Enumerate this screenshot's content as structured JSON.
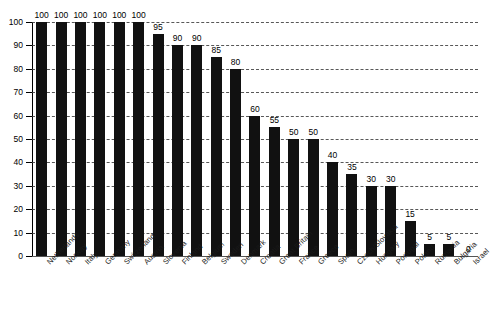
{
  "chart_data": {
    "type": "bar",
    "title": "",
    "subtitle": "",
    "xlabel": "",
    "ylabel": "",
    "ylim": [
      0,
      100
    ],
    "grid": true,
    "legend": "none",
    "value_labels": true,
    "bar_color": "#111111",
    "categories": [
      "Netherlands",
      "Norway",
      "Italy",
      "Germany",
      "Switzerland",
      "Austria",
      "Slovenia",
      "Finland",
      "Belgium",
      "Sweden",
      "Denmark",
      "Croatia",
      "Great Britain",
      "France",
      "Greece",
      "Spain",
      "Czech/Slovakia",
      "Hungary",
      "Portugal",
      "Poland",
      "Rumania",
      "Bulgaria",
      "Israel"
    ],
    "values": [
      100,
      100,
      100,
      100,
      100,
      100,
      95,
      90,
      90,
      85,
      80,
      60,
      55,
      50,
      50,
      40,
      35,
      30,
      30,
      15,
      5,
      5,
      0
    ],
    "value_label_text": [
      "100",
      "100",
      "100",
      "100",
      "100",
      "100",
      "95",
      "90",
      "90",
      "85",
      "80",
      "60",
      "55",
      "50",
      "50",
      "40",
      "35",
      "30",
      "30",
      "15",
      "5",
      "5",
      "0"
    ],
    "yticks": [
      0,
      10,
      20,
      30,
      40,
      50,
      60,
      70,
      80,
      90,
      100
    ],
    "ytick_labels": [
      "0",
      "10",
      "20",
      "30",
      "40",
      "50",
      "60",
      "70",
      "80",
      "90",
      "100"
    ]
  }
}
